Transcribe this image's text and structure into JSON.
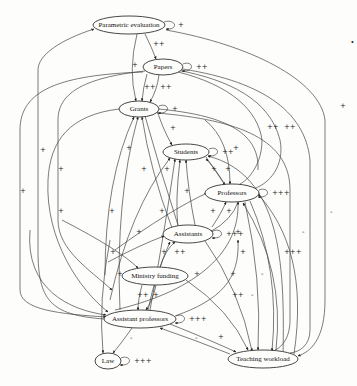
{
  "nodes": [
    {
      "id": "parametric_evaluation",
      "label": "Parametric evaluation",
      "cx": 129,
      "cy": 25,
      "rx": 36,
      "ry": 9,
      "self_loop": "+"
    },
    {
      "id": "papers",
      "label": "Papers",
      "cx": 163,
      "cy": 67,
      "rx": 20,
      "ry": 8,
      "self_loop": "++"
    },
    {
      "id": "grants",
      "label": "Grants",
      "cx": 139,
      "cy": 109,
      "rx": 20,
      "ry": 8,
      "self_loop": "+"
    },
    {
      "id": "students",
      "label": "Students",
      "cx": 186,
      "cy": 152,
      "rx": 23,
      "ry": 8,
      "self_loop": "++"
    },
    {
      "id": "professors",
      "label": "Professors",
      "cx": 232,
      "cy": 193,
      "rx": 27,
      "ry": 9,
      "self_loop": "+++"
    },
    {
      "id": "assistants",
      "label": "Assistants",
      "cx": 188,
      "cy": 234,
      "rx": 25,
      "ry": 9,
      "self_loop": "+++"
    },
    {
      "id": "ministry_funding",
      "label": "Ministry funding",
      "cx": 155,
      "cy": 276,
      "rx": 33,
      "ry": 9,
      "self_loop": ""
    },
    {
      "id": "assistant_professors",
      "label": "Assistant professors",
      "cx": 140,
      "cy": 319,
      "rx": 36,
      "ry": 9,
      "self_loop": "+++"
    },
    {
      "id": "law",
      "label": "Law",
      "cx": 108,
      "cy": 361,
      "rx": 13,
      "ry": 8,
      "self_loop": "+++"
    },
    {
      "id": "teaching_workload",
      "label": "Teaching workload",
      "cx": 263,
      "cy": 359,
      "rx": 35,
      "ry": 9,
      "self_loop": ""
    }
  ],
  "edge_labels": [
    {
      "text": "++",
      "x": 153,
      "y": 46
    },
    {
      "text": "+",
      "x": 132,
      "y": 67
    },
    {
      "text": "++",
      "x": 144,
      "y": 89
    },
    {
      "text": "++",
      "x": 160,
      "y": 89
    },
    {
      "text": "+",
      "x": 340,
      "y": 108
    },
    {
      "text": "++",
      "x": 267,
      "y": 129
    },
    {
      "text": "++",
      "x": 284,
      "y": 129
    },
    {
      "text": "+",
      "x": 20,
      "y": 193
    },
    {
      "text": "+",
      "x": 40,
      "y": 152
    },
    {
      "text": "+",
      "x": 58,
      "y": 171
    },
    {
      "text": "+",
      "x": 58,
      "y": 213
    },
    {
      "text": "+",
      "x": 126,
      "y": 150
    },
    {
      "text": "+",
      "x": 141,
      "y": 171
    },
    {
      "text": "+",
      "x": 164,
      "y": 171
    },
    {
      "text": "+",
      "x": 170,
      "y": 130
    },
    {
      "text": "+",
      "x": 233,
      "y": 150
    },
    {
      "text": "+",
      "x": 211,
      "y": 171
    },
    {
      "text": "+",
      "x": 225,
      "y": 171
    },
    {
      "text": "+",
      "x": 184,
      "y": 193
    },
    {
      "text": "+",
      "x": 109,
      "y": 213
    },
    {
      "text": "+",
      "x": 159,
      "y": 213
    },
    {
      "text": "+",
      "x": 136,
      "y": 234
    },
    {
      "text": "+",
      "x": 210,
      "y": 213
    },
    {
      "text": "+",
      "x": 226,
      "y": 213
    },
    {
      "text": "+",
      "x": 235,
      "y": 234
    },
    {
      "text": "+",
      "x": 110,
      "y": 254
    },
    {
      "text": "+",
      "x": 161,
      "y": 254
    },
    {
      "text": "++",
      "x": 174,
      "y": 254
    },
    {
      "text": "+",
      "x": 240,
      "y": 254
    },
    {
      "text": "+",
      "x": 117,
      "y": 276
    },
    {
      "text": "+",
      "x": 194,
      "y": 276
    },
    {
      "text": "+",
      "x": 230,
      "y": 276
    },
    {
      "text": "++",
      "x": 137,
      "y": 297
    },
    {
      "text": "+",
      "x": 153,
      "y": 297
    },
    {
      "text": "++",
      "x": 232,
      "y": 297
    },
    {
      "text": "-",
      "x": 251,
      "y": 297
    },
    {
      "text": "-",
      "x": 261,
      "y": 276
    },
    {
      "text": "+++",
      "x": 284,
      "y": 254
    },
    {
      "text": "-",
      "x": 302,
      "y": 234
    },
    {
      "text": "-",
      "x": 330,
      "y": 214
    },
    {
      "text": "-",
      "x": 130,
      "y": 340
    },
    {
      "text": "-",
      "x": 195,
      "y": 340
    },
    {
      "text": "+",
      "x": 218,
      "y": 339
    }
  ],
  "standalone_mark": "•"
}
